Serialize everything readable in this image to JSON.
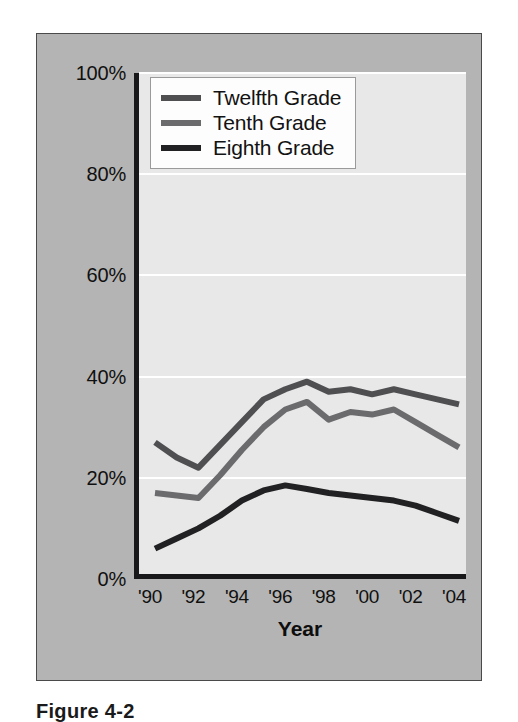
{
  "chart_data": {
    "type": "line",
    "title": "",
    "xlabel": "Year",
    "ylabel": "",
    "grid": true,
    "legend_position": "top-left inside plot",
    "xlim": [
      1990,
      2004
    ],
    "ylim": [
      0,
      100
    ],
    "yticklabels": [
      "100%",
      "80%",
      "60%",
      "40%",
      "20%",
      "0%"
    ],
    "ytickvalues": [
      100,
      80,
      60,
      40,
      20,
      0
    ],
    "xticklabels": [
      "'90",
      "'92",
      "'94",
      "'96",
      "'98",
      "'00",
      "'02",
      "'04"
    ],
    "xtickvalues": [
      1990,
      1992,
      1994,
      1996,
      1998,
      2000,
      2002,
      2004
    ],
    "x": [
      1990,
      1991,
      1992,
      1993,
      1994,
      1995,
      1996,
      1997,
      1998,
      1999,
      2000,
      2001,
      2002,
      2003,
      2004
    ],
    "series": [
      {
        "name": "Twelfth Grade",
        "color": "#4f4f52",
        "values": [
          27.0,
          24.0,
          22.0,
          26.5,
          31.0,
          35.5,
          37.5,
          39.0,
          37.0,
          37.5,
          36.5,
          37.5,
          36.5,
          35.5,
          34.5
        ]
      },
      {
        "name": "Tenth Grade",
        "color": "#6b6b6e",
        "values": [
          17.0,
          16.5,
          16.0,
          20.5,
          25.5,
          30.0,
          33.5,
          35.0,
          31.5,
          33.0,
          32.5,
          33.5,
          31.0,
          28.5,
          26.0
        ]
      },
      {
        "name": "Eighth Grade",
        "color": "#212123",
        "values": [
          6.0,
          8.0,
          10.0,
          12.5,
          15.5,
          17.5,
          18.5,
          17.8,
          17.0,
          16.5,
          16.0,
          15.5,
          14.5,
          13.0,
          11.5
        ]
      }
    ]
  },
  "legend": {
    "items": [
      {
        "label": "Twelfth Grade",
        "color": "#4f4f52"
      },
      {
        "label": "Tenth Grade",
        "color": "#6b6b6e"
      },
      {
        "label": "Eighth Grade",
        "color": "#212123"
      }
    ]
  },
  "caption": {
    "text": "Figure 4-2"
  },
  "colors": {
    "panel_background": "#b4b4b4",
    "plot_background": "#e8e8e8",
    "axis": "#18181a",
    "gridline": "#ffffff"
  }
}
